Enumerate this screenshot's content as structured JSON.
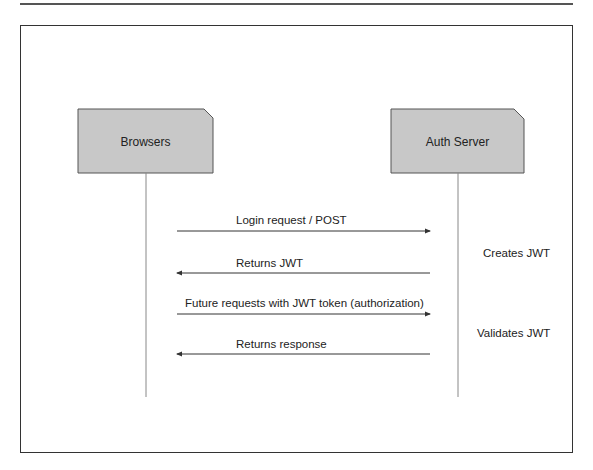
{
  "diagram": {
    "type": "sequence",
    "participants": [
      {
        "id": "browsers",
        "label": "Browsers"
      },
      {
        "id": "auth_server",
        "label": "Auth Server"
      }
    ],
    "messages": [
      {
        "from": "browsers",
        "to": "auth_server",
        "label": "Login request / POST"
      },
      {
        "from": "auth_server",
        "to": "browsers",
        "label": "Returns JWT"
      },
      {
        "from": "browsers",
        "to": "auth_server",
        "label": "Future requests with JWT token (authorization)"
      },
      {
        "from": "auth_server",
        "to": "browsers",
        "label": "Returns response"
      }
    ],
    "notes": [
      {
        "participant": "auth_server",
        "label": "Creates JWT"
      },
      {
        "participant": "auth_server",
        "label": "Validates JWT"
      }
    ],
    "colors": {
      "box_fill": "#c8c8c8",
      "box_border": "#555555",
      "line": "#333333",
      "lifeline": "#888888"
    }
  }
}
